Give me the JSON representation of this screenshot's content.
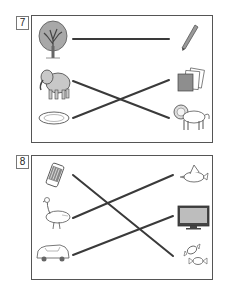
{
  "exercises": [
    {
      "number": "7",
      "left_items": [
        "tree",
        "elephant",
        "plate"
      ],
      "right_items": [
        "pencil",
        "papers",
        "lion"
      ],
      "connections": [
        {
          "from": "tree",
          "to": "pencil"
        },
        {
          "from": "elephant",
          "to": "lion"
        },
        {
          "from": "plate",
          "to": "papers"
        }
      ]
    },
    {
      "number": "8",
      "left_items": [
        "eraser",
        "goose",
        "car"
      ],
      "right_items": [
        "bird",
        "tv",
        "candy"
      ],
      "connections": [
        {
          "from": "eraser",
          "to": "candy"
        },
        {
          "from": "goose",
          "to": "bird"
        },
        {
          "from": "car",
          "to": "tv"
        }
      ]
    }
  ],
  "colors": {
    "line": "#3a3a3a",
    "frame": "#555555",
    "fill_gray": "#9a9a9a"
  }
}
